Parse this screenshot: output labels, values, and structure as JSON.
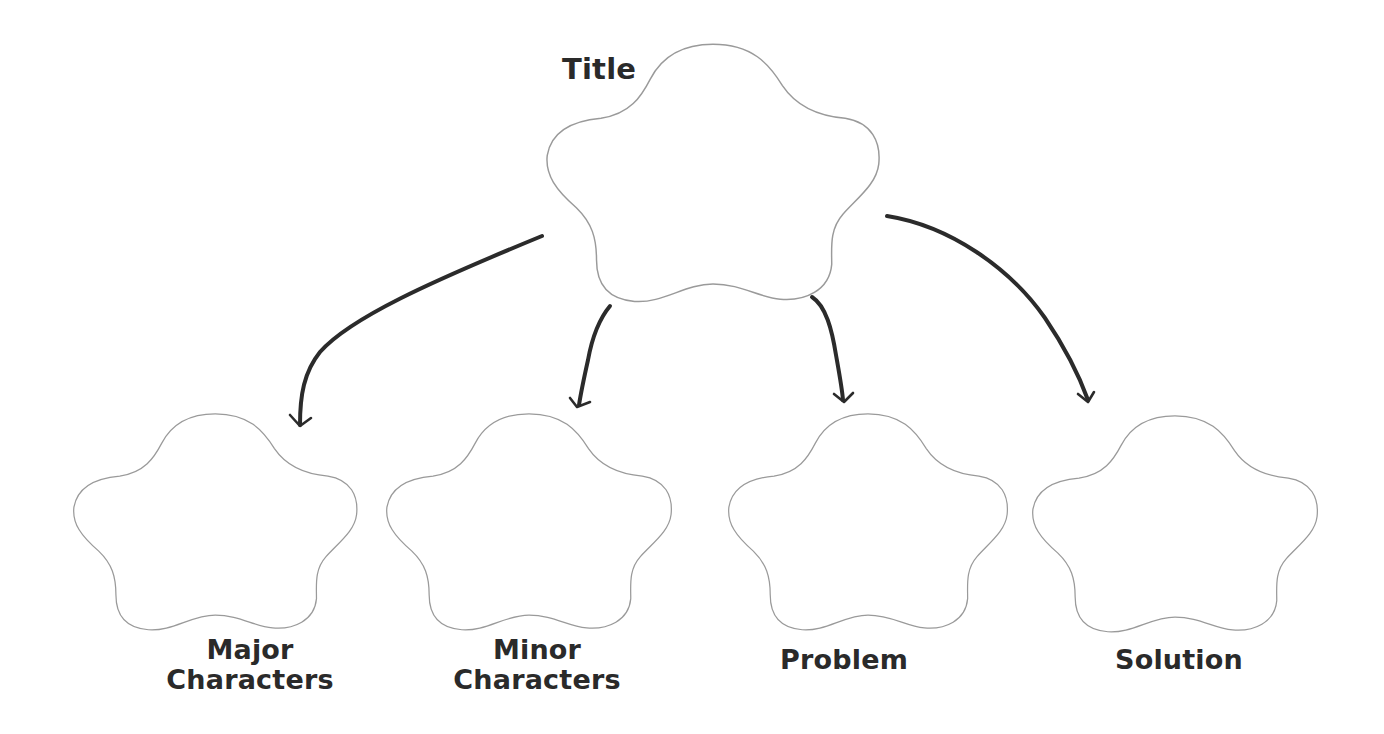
{
  "diagram": {
    "type": "story-map graphic organizer",
    "root": {
      "label": "Title"
    },
    "children": [
      {
        "label_line1": "Major",
        "label_line2": "Characters"
      },
      {
        "label_line1": "Minor",
        "label_line2": "Characters"
      },
      {
        "label_line1": "Problem",
        "label_line2": ""
      },
      {
        "label_line1": "Solution",
        "label_line2": ""
      }
    ],
    "colors": {
      "outline": "#9a9a9a",
      "arrow": "#2b2b2b",
      "text": "#2a2a2a",
      "background": "#ffffff"
    }
  }
}
